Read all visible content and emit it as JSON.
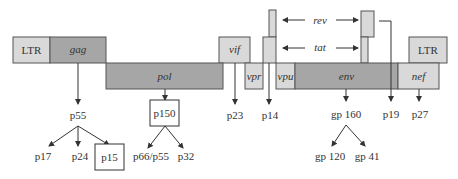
{
  "diagram": {
    "colors": {
      "light": "#d9d9d9",
      "dark": "#a6a6a6",
      "stroke": "#555555",
      "line": "#333333"
    },
    "genes": {
      "ltr_left": "LTR",
      "gag": "gag",
      "pol": "pol",
      "vif": "vif",
      "vpr": "vpr",
      "vpu": "vpu",
      "env": "env",
      "nef": "nef",
      "ltr_right": "LTR",
      "rev": "rev",
      "tat": "tat"
    },
    "proteins": {
      "p55": "p55",
      "p17": "p17",
      "p24": "p24",
      "p15": "p15",
      "p150": "p150",
      "p66p55": "p66/p55",
      "p32": "p32",
      "p23": "p23",
      "p14": "p14",
      "gp160": "gp 160",
      "gp120": "gp 120",
      "gp41": "gp 41",
      "p19": "p19",
      "p27": "p27"
    }
  }
}
